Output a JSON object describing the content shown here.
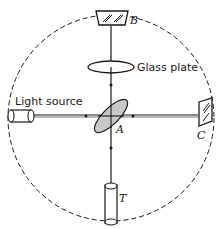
{
  "diagram": {
    "labels": {
      "mirror_b": "B",
      "glass_plate": "Glass plate",
      "light_source": "Light source",
      "beam_splitter": "A",
      "mirror_c": "C",
      "telescope": "T"
    },
    "colors": {
      "line": "#1a1a1a",
      "splitter_fill": "#c8c8c8",
      "background": "#ffffff"
    }
  }
}
